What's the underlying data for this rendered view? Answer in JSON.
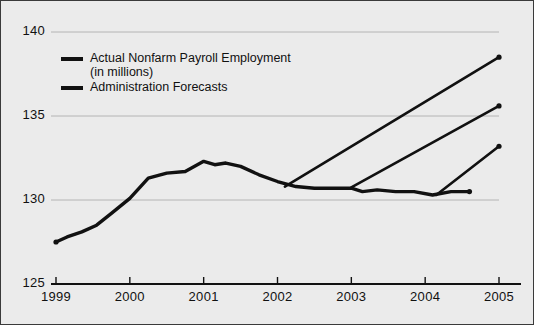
{
  "chart_data": {
    "type": "line",
    "title": "",
    "xlabel": "",
    "ylabel": "",
    "xlim": [
      1999,
      2005
    ],
    "ylim": [
      125,
      140
    ],
    "grid": true,
    "gridlines_y": [
      130,
      135,
      140
    ],
    "x_ticks": [
      "1999",
      "2000",
      "2001",
      "2002",
      "2003",
      "2004",
      "2005"
    ],
    "y_ticks": [
      "125",
      "130",
      "135",
      "140"
    ],
    "legend_position": "upper-left-inside",
    "series": [
      {
        "name": "Actual Nonfarm Payroll Employment (in millions)",
        "color": "#111111",
        "x": [
          1999.0,
          1999.15,
          1999.35,
          1999.55,
          1999.75,
          2000.0,
          2000.25,
          2000.5,
          2000.75,
          2001.0,
          2001.15,
          2001.3,
          2001.5,
          2001.75,
          2002.0,
          2002.25,
          2002.5,
          2002.75,
          2003.0,
          2003.15,
          2003.35,
          2003.6,
          2003.85,
          2004.1,
          2004.35,
          2004.6
        ],
        "y": [
          127.5,
          127.8,
          128.1,
          128.5,
          129.2,
          130.1,
          131.3,
          131.6,
          131.7,
          132.3,
          132.1,
          132.2,
          132.0,
          131.5,
          131.1,
          130.8,
          130.7,
          130.7,
          130.7,
          130.5,
          130.6,
          130.5,
          130.5,
          130.3,
          130.5,
          130.5
        ],
        "end_marker": true
      },
      {
        "name": "Administration Forecasts 1",
        "color": "#111111",
        "x": [
          2002.1,
          2005.0
        ],
        "y": [
          130.8,
          138.5
        ],
        "end_marker": true
      },
      {
        "name": "Administration Forecasts 2",
        "color": "#111111",
        "x": [
          2003.0,
          2005.0
        ],
        "y": [
          130.75,
          135.6
        ],
        "end_marker": true
      },
      {
        "name": "Administration Forecasts 3",
        "color": "#111111",
        "x": [
          2004.15,
          2005.0
        ],
        "y": [
          130.3,
          133.2
        ],
        "end_marker": true
      }
    ]
  },
  "legend": {
    "items": [
      {
        "label": "Actual Nonfarm Payroll Employment\n(in millions)",
        "color": "#111111"
      },
      {
        "label": "Administration Forecasts",
        "color": "#111111"
      }
    ]
  },
  "axes": {
    "y_labels": [
      "140",
      "135",
      "130",
      "125"
    ],
    "x_labels": [
      "1999",
      "2000",
      "2001",
      "2002",
      "2003",
      "2004",
      "2005"
    ]
  },
  "colors": {
    "background": "#ebebeb",
    "line": "#111111",
    "grid": "#b4b4b4",
    "axis": "#111111",
    "border": "#3a3a3a"
  }
}
